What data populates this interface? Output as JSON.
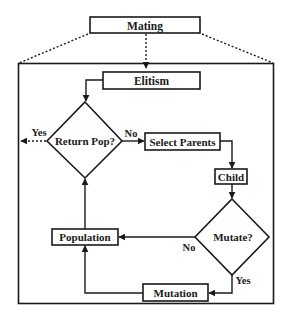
{
  "diagram": {
    "title_box": "Mating",
    "nodes": {
      "elitism": "Elitism",
      "return_pop": "Return Pop?",
      "select_parents": "Select Parents",
      "child": "Child",
      "mutate": "Mutate?",
      "population": "Population",
      "mutation": "Mutation"
    },
    "edge_labels": {
      "return_yes": "Yes",
      "return_no": "No",
      "mutate_no": "No",
      "mutate_yes": "Yes"
    }
  },
  "colors": {
    "stroke": "#1a1a1a",
    "background": "#ffffff"
  }
}
